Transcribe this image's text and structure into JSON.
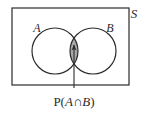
{
  "figure": {
    "type": "venn-diagram",
    "title": "",
    "background_color": "#ffffff",
    "stroke_color": "#2b2b2b",
    "shade_color": "#a9a9a9"
  },
  "labels": {
    "universe": "S",
    "set_a": "A",
    "set_b": "B",
    "annotation": "P(A∩B)",
    "annotation_parts": {
      "prefix": "P(",
      "left_set": "A",
      "operator": "∩",
      "right_set": "B",
      "suffix": ")"
    }
  },
  "geometry": {
    "rectangle": {
      "x": 12,
      "y": 8,
      "width": 117,
      "height": 77
    },
    "circle_a": {
      "cx": 55,
      "cy": 51,
      "r": 23
    },
    "circle_b": {
      "cx": 93,
      "cy": 51,
      "r": 23
    },
    "arrow": {
      "x": 74,
      "y_tail": 88,
      "y_tip": 45
    }
  }
}
